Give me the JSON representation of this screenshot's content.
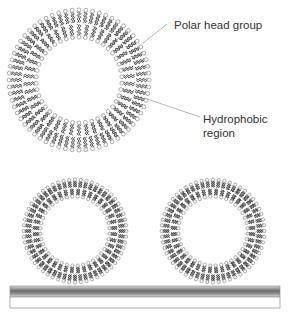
{
  "figure": {
    "type": "lipid vesicles diagram",
    "labels": {
      "polar_head_group": "Polar head group",
      "hydrophobic_region_line1": "Hydrophobic",
      "hydrophobic_region_line2": "region"
    },
    "vesicles": [
      {
        "name": "large-vesicle",
        "cx": 79,
        "cy": 80,
        "r_outer": 72,
        "r_inner": 41,
        "count": 64
      },
      {
        "name": "small-vesicle-left",
        "cx": 75,
        "cy": 231,
        "r_outer": 53,
        "r_inner": 33,
        "count": 56
      },
      {
        "name": "small-vesicle-right",
        "cx": 213,
        "cy": 231,
        "r_outer": 53,
        "r_inner": 33,
        "count": 56
      }
    ],
    "leader_lines": [
      {
        "name": "polar-head-leader",
        "x1": 143,
        "y1": 43,
        "x2": 167,
        "y2": 24
      },
      {
        "name": "hydrophobic-leader",
        "x1": 147,
        "y1": 99,
        "x2": 200,
        "y2": 117
      }
    ],
    "substrate": {
      "x": 10,
      "y": 286,
      "width": 270,
      "height": 22
    },
    "colors": {
      "head_stroke": "#8a8a8a",
      "tail": "#3a3a3a",
      "leader": "#b0b0b0",
      "text": "#333333"
    }
  }
}
